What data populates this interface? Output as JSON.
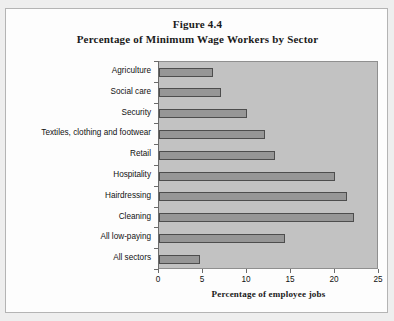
{
  "figure": {
    "title_line1": "Figure 4.4",
    "title_line2": "Percentage of Minimum Wage Workers by Sector"
  },
  "chart_data": {
    "type": "bar",
    "orientation": "horizontal",
    "title": "Figure 4.4 Percentage of Minimum Wage Workers by Sector",
    "xlabel": "Percentage of employee jobs",
    "ylabel": "",
    "xlim": [
      0,
      25
    ],
    "xticks": [
      0,
      5,
      10,
      15,
      20,
      25
    ],
    "xtick_labels": [
      "0",
      "5",
      "10",
      "15",
      "20",
      "25"
    ],
    "grid": false,
    "legend": null,
    "plot_background": "#c2c2c2",
    "bar_fill": "#969696",
    "bar_edge": "#4d4d4d",
    "categories": [
      "Agriculture",
      "Social care",
      "Security",
      "Textiles, clothing and footwear",
      "Retail",
      "Hospitality",
      "Hairdressing",
      "Cleaning",
      "All low-paying",
      "All sectors"
    ],
    "values": [
      6.1,
      7.1,
      10.0,
      12.0,
      13.2,
      20.0,
      21.4,
      22.2,
      14.3,
      4.7
    ]
  }
}
